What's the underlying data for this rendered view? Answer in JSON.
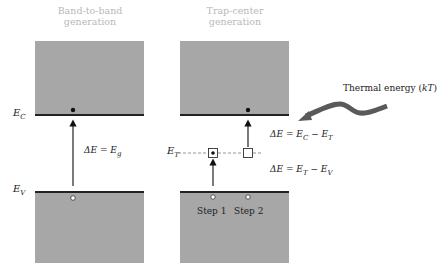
{
  "panels": [
    {
      "title_line1": "Band-to-band",
      "title_line2": "generation"
    },
    {
      "title_line1": "Trap-center",
      "title_line2": "generation"
    }
  ],
  "labels": {
    "ec": "E",
    "ec_sub": "C",
    "ev": "E",
    "ev_sub": "V",
    "et": "E",
    "et_sub": "T",
    "delta_eg": "ΔE = E",
    "delta_eg_sub": "g",
    "delta_ec_et_a": "ΔE = E",
    "delta_ec_et_sub1": "C",
    "delta_ec_et_b": " − E",
    "delta_ec_et_sub2": "T",
    "delta_et_ev_a": "ΔE = E",
    "delta_et_ev_sub1": "T",
    "delta_et_ev_b": " − E",
    "delta_et_ev_sub2": "V",
    "step1": "Step 1",
    "step2": "Step 2",
    "thermal": "Thermal energy (",
    "thermal_kt": "kT",
    "thermal_close": ")"
  },
  "colors": {
    "band": "#a7a7a7",
    "edge": "#222222",
    "title": "#b8b8b8",
    "arrow": "#5a5a5a"
  }
}
